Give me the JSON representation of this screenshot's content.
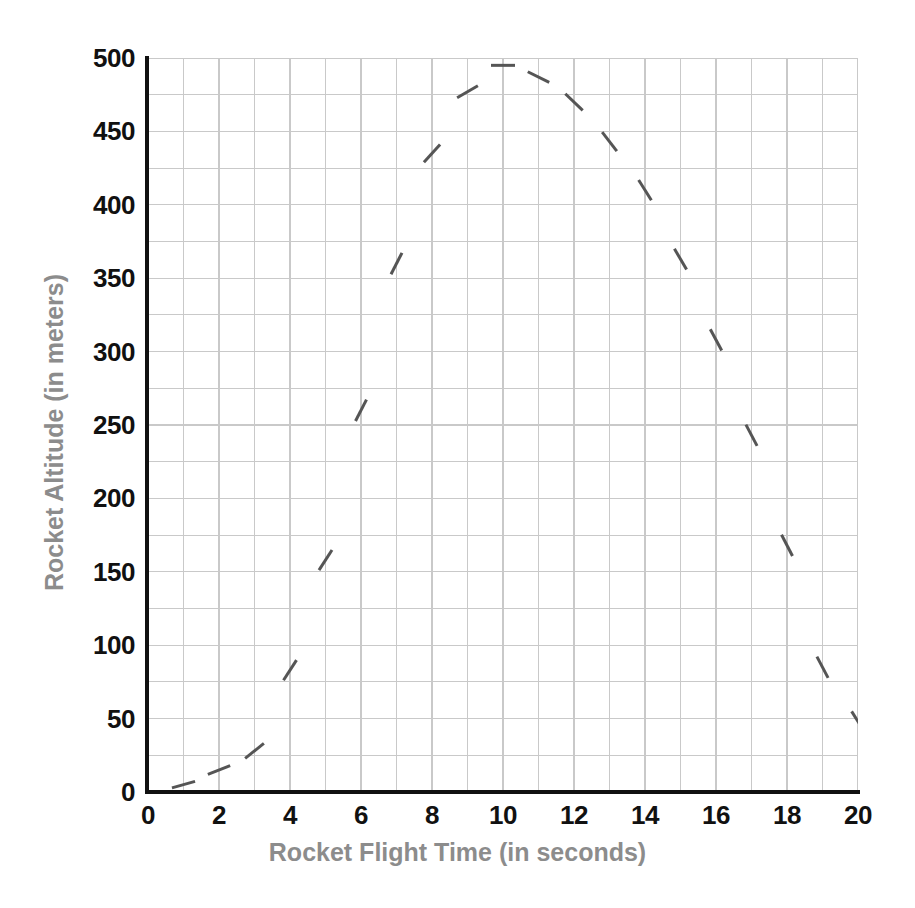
{
  "figure": {
    "header_faint_text": "",
    "background_color": "#ffffff"
  },
  "chart_data": {
    "type": "scatter",
    "title": "",
    "subtitle": "",
    "xlabel": "Rocket Flight Time (in seconds)",
    "ylabel": "Rocket Altitude (in meters)",
    "xlim": [
      0,
      20
    ],
    "ylim": [
      0,
      500
    ],
    "x_major_ticks": [
      0,
      2,
      4,
      6,
      8,
      10,
      12,
      14,
      16,
      18,
      20
    ],
    "x_tick_labels": [
      "0",
      "2",
      "4",
      "6",
      "8",
      "10",
      "12",
      "14",
      "16",
      "18",
      "20"
    ],
    "y_major_ticks": [
      0,
      50,
      100,
      150,
      200,
      250,
      300,
      350,
      400,
      450,
      500
    ],
    "y_tick_labels": [
      "0",
      "50",
      "100",
      "150",
      "200",
      "250",
      "300",
      "350",
      "400",
      "450",
      "500"
    ],
    "x_minor_step": 1,
    "y_minor_step": 25,
    "grid": true,
    "grid_color": "#c9c9c9",
    "axis_color": "#111111",
    "tick_label_color": "#111111",
    "axis_title_color": "#8c8c8c",
    "legend": null,
    "legend_position": "none",
    "marker_style": "short-dash-segment",
    "marker_color": "#555555",
    "marker_length": 24,
    "marker_width": 3,
    "x": [
      1,
      2,
      3,
      4,
      5,
      6,
      7,
      8,
      9,
      10,
      11,
      12,
      13,
      14,
      15,
      16,
      17,
      18,
      19,
      20
    ],
    "values": [
      5,
      15,
      28,
      83,
      158,
      260,
      360,
      435,
      477,
      495,
      487,
      470,
      443,
      410,
      363,
      308,
      243,
      168,
      85,
      48
    ],
    "series": [
      {
        "name": "Rocket Altitude",
        "color": "#555555",
        "points": [
          {
            "t": 1,
            "altitude": 5,
            "slope": 0.28
          },
          {
            "t": 2,
            "altitude": 15,
            "slope": 0.4
          },
          {
            "t": 3,
            "altitude": 28,
            "slope": 0.8
          },
          {
            "t": 4,
            "altitude": 83,
            "slope": 1.55
          },
          {
            "t": 5,
            "altitude": 158,
            "slope": 1.55
          },
          {
            "t": 6,
            "altitude": 260,
            "slope": 1.95
          },
          {
            "t": 7,
            "altitude": 360,
            "slope": 1.95
          },
          {
            "t": 8,
            "altitude": 435,
            "slope": 1.1
          },
          {
            "t": 9,
            "altitude": 477,
            "slope": 0.58
          },
          {
            "t": 10,
            "altitude": 495,
            "slope": 0.0
          },
          {
            "t": 11,
            "altitude": 487,
            "slope": -0.5
          },
          {
            "t": 12,
            "altitude": 470,
            "slope": -0.95
          },
          {
            "t": 13,
            "altitude": 443,
            "slope": -1.3
          },
          {
            "t": 14,
            "altitude": 410,
            "slope": -1.6
          },
          {
            "t": 15,
            "altitude": 363,
            "slope": -1.7
          },
          {
            "t": 16,
            "altitude": 308,
            "slope": -1.85
          },
          {
            "t": 17,
            "altitude": 243,
            "slope": -1.9
          },
          {
            "t": 18,
            "altitude": 168,
            "slope": -1.95
          },
          {
            "t": 19,
            "altitude": 85,
            "slope": -1.9
          },
          {
            "t": 20,
            "altitude": 48,
            "slope": -1.6
          }
        ]
      }
    ]
  }
}
